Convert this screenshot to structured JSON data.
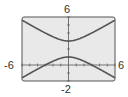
{
  "chart_data": {
    "type": "line",
    "title": "",
    "xlabel": "",
    "ylabel": "",
    "xlim": [
      -6,
      6
    ],
    "ylim": [
      -2,
      6
    ],
    "x_tick_step": 1,
    "y_tick_step": 1,
    "grid": false,
    "tick_labels": {
      "xmin": "-6",
      "xmax": "6",
      "ymin": "-2",
      "ymax": "6"
    },
    "series": [
      {
        "name": "upper branch",
        "equation": "y = 2 + sqrt(1 + x^2/3)",
        "x": [
          -6,
          -4,
          -2,
          0,
          2,
          4,
          6
        ],
        "y": [
          5.61,
          4.52,
          3.53,
          3.0,
          3.53,
          4.52,
          5.61
        ]
      },
      {
        "name": "lower branch",
        "equation": "y = 2 - sqrt(1 + x^2/3)",
        "x": [
          -6,
          -4,
          -2,
          0,
          2,
          4,
          6
        ],
        "y": [
          -1.61,
          -0.52,
          0.47,
          1.0,
          0.47,
          -0.52,
          -1.61
        ]
      }
    ],
    "colors": {
      "background": "#e9e9e9",
      "frame": "#555555",
      "curve": "#555555",
      "axis": "#555555"
    }
  }
}
